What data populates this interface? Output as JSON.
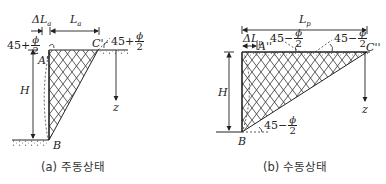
{
  "figure": {
    "panel_a": {
      "caption": "(a) 주동상태",
      "labels": {
        "delta_L": "ΔL",
        "delta_L_sub": "a",
        "L": "L",
        "L_sub": "a",
        "A_point": "A'",
        "C_point": "C'",
        "B_point": "B",
        "H": "H",
        "z": "z"
      },
      "angle_left": {
        "prefix": "45+",
        "num": "ϕ",
        "den": "2"
      },
      "angle_right": {
        "prefix": "45+",
        "num": "ϕ",
        "den": "2"
      }
    },
    "panel_b": {
      "caption": "(b) 수동상태",
      "labels": {
        "L": "L",
        "L_sub": "p",
        "delta_L": "ΔL",
        "delta_L_sub": "p",
        "A_point": "A''",
        "C_point": "C''",
        "B_point": "B",
        "H": "H",
        "z": "z"
      },
      "angle_top_left": {
        "prefix": "45−",
        "num": "ϕ",
        "den": "2"
      },
      "angle_top_right": {
        "prefix": "45−",
        "num": "ϕ",
        "den": "2"
      },
      "angle_bottom": {
        "prefix": "45−",
        "num": "ϕ",
        "den": "2"
      }
    },
    "colors": {
      "line": "#222222",
      "hatch": "#333333",
      "background": "#ffffff"
    }
  }
}
